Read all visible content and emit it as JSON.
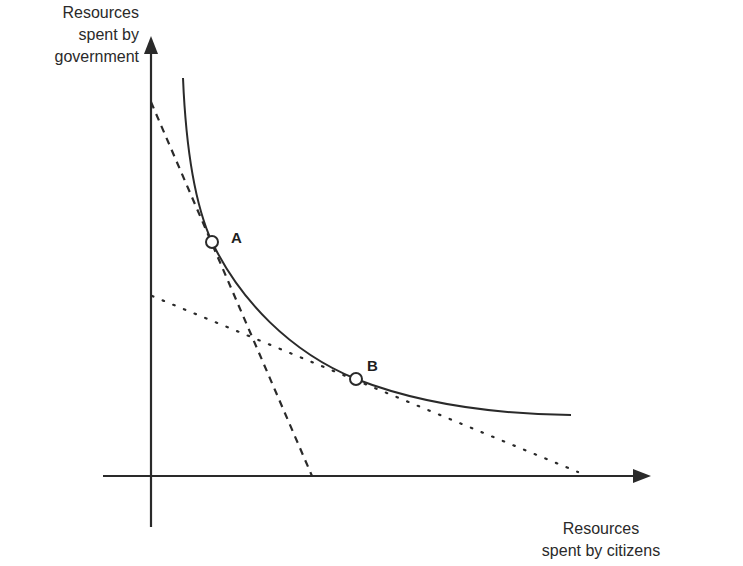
{
  "diagram": {
    "y_axis": {
      "label_lines": [
        "Resources",
        "spent by",
        "government"
      ]
    },
    "x_axis": {
      "label_lines": [
        "Resources",
        "spent by citizens"
      ]
    },
    "points": [
      {
        "id": "A",
        "label": "A"
      },
      {
        "id": "B",
        "label": "B"
      }
    ],
    "curves": [
      {
        "name": "isoquant",
        "style": "solid",
        "description": "convex curve from upper-left to lower-right"
      },
      {
        "name": "steep-line",
        "style": "dashed",
        "tangent_at": "A"
      },
      {
        "name": "shallow-line",
        "style": "dotted",
        "tangent_at": "B"
      }
    ],
    "colors": {
      "ink": "#2a2a2a",
      "background": "#ffffff"
    }
  }
}
